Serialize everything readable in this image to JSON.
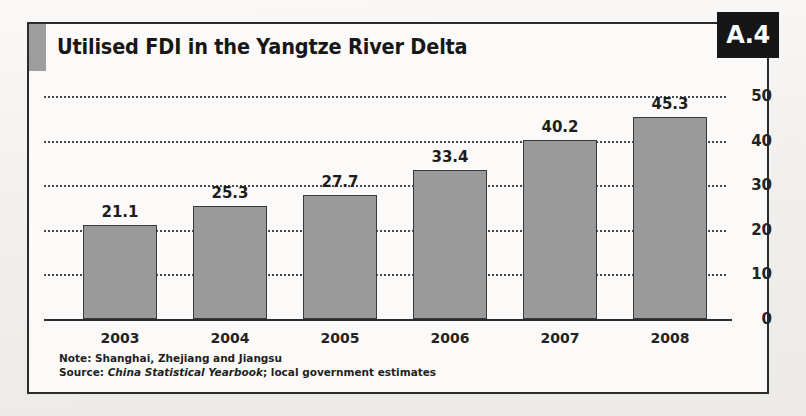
{
  "figure": {
    "title": "Utilised FDI in the Yangtze River Delta",
    "badge": "A.4",
    "accent_color": "#9d9d9d",
    "badge_bg": "#161616",
    "bar_color": "#9a9a9a",
    "bar_border_color": "#3a3a3a",
    "frame_color": "#2b2b2b"
  },
  "footnotes": {
    "note_lead": "Note: ",
    "note_text": "Shanghai, Zhejiang and Jiangsu",
    "source_lead": "Source: ",
    "source_pub": "China Statistical Yearbook",
    "source_rest": "; local government estimates"
  },
  "chart_data": {
    "type": "bar",
    "title": "Utilised FDI in the Yangtze River Delta",
    "xlabel": "",
    "ylabel": "",
    "categories": [
      "2003",
      "2004",
      "2005",
      "2006",
      "2007",
      "2008"
    ],
    "values": [
      21.1,
      25.3,
      27.7,
      33.4,
      40.2,
      45.3
    ],
    "value_labels": [
      "21.1",
      "25.3",
      "27.7",
      "33.4",
      "40.2",
      "45.3"
    ],
    "ylim": [
      0,
      50
    ],
    "yticks": [
      0,
      10,
      20,
      30,
      40,
      50
    ],
    "ytick_labels": [
      "0",
      "10",
      "20",
      "30",
      "40",
      "50"
    ],
    "grid": true,
    "grid_style": "dotted",
    "legend": false,
    "series": [
      {
        "name": "Utilised FDI",
        "values": [
          21.1,
          25.3,
          27.7,
          33.4,
          40.2,
          45.3
        ]
      }
    ]
  }
}
